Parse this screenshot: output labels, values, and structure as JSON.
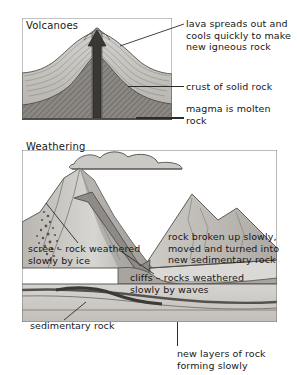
{
  "page": {
    "background": "#ffffff",
    "ink": "#171717",
    "rock_light": "#cfcdc9",
    "rock_mid": "#b2afaa",
    "rock_dark": "#8e8b86",
    "magma_dark": "#6f6c68",
    "frame": "#4a4a4a"
  },
  "volcano_panel": {
    "heading": "Volcanoes",
    "labels": [
      {
        "id": "lava",
        "text": "lava spreads out and\ncools quickly to make\nnew igneous rock"
      },
      {
        "id": "crust",
        "text": "crust of solid rock"
      },
      {
        "id": "magma",
        "text": "magma is molten\nrock"
      }
    ],
    "features": {
      "vent_arrow": "upward-arrow",
      "crust_layers": "banded sedimentary layers",
      "magma_chamber": "hatched dark mass"
    }
  },
  "weathering_panel": {
    "heading": "Weathering",
    "labels": [
      {
        "id": "scree",
        "text": "scree – rock weathered\nslowly by ice"
      },
      {
        "id": "broken",
        "text": "rock broken up slowly,\nmoved and turned into\nnew sedimentary rock"
      },
      {
        "id": "cliffs",
        "text": "cliffs – rocks weathered\nslowly by waves"
      },
      {
        "id": "sedimentary",
        "text": "sedimentary rock"
      },
      {
        "id": "newlayers",
        "text": "new layers of rock\nforming slowly"
      }
    ],
    "features": {
      "cloud": "cloud above mountains",
      "glacier_arrow": "down-right arrow on mountain flank",
      "scree_slope": "stippled debris slope",
      "sea": "water body at right",
      "strata": "stacked sediment layers"
    }
  }
}
